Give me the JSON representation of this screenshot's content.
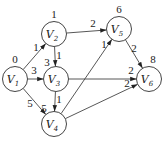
{
  "diagram": {
    "type": "weighted-directed-graph",
    "nodes": [
      {
        "id": "V1",
        "name": "V",
        "sub": "1",
        "x": 15,
        "y": 79,
        "value": "0",
        "vx": 15,
        "vy": 63
      },
      {
        "id": "V2",
        "name": "V",
        "sub": "2",
        "x": 54,
        "y": 34,
        "value": "1",
        "vx": 54,
        "vy": 18
      },
      {
        "id": "V3",
        "name": "V",
        "sub": "3",
        "x": 56,
        "y": 79,
        "value": "3",
        "vx": 47,
        "vy": 66
      },
      {
        "id": "V4",
        "name": "V",
        "sub": "4",
        "x": 54,
        "y": 124,
        "value": "5",
        "vx": 44,
        "vy": 112
      },
      {
        "id": "V5",
        "name": "V",
        "sub": "5",
        "x": 119,
        "y": 29,
        "value": "6",
        "vx": 119,
        "vy": 13
      },
      {
        "id": "V6",
        "name": "V",
        "sub": "6",
        "x": 149,
        "y": 79,
        "value": "8",
        "vx": 153,
        "vy": 63
      }
    ],
    "edges": [
      {
        "from": "V1",
        "to": "V2",
        "weight": "1",
        "lx": 36,
        "ly": 51
      },
      {
        "from": "V1",
        "to": "V3",
        "weight": "3",
        "lx": 34,
        "ly": 74
      },
      {
        "from": "V1",
        "to": "V4",
        "weight": "5",
        "lx": 30,
        "ly": 107
      },
      {
        "from": "V2",
        "to": "V3",
        "weight": "1",
        "lx": 59,
        "ly": 59
      },
      {
        "from": "V2",
        "to": "V5",
        "weight": "2",
        "lx": 93,
        "ly": 27
      },
      {
        "from": "V3",
        "to": "V4",
        "weight": "1",
        "lx": 59,
        "ly": 103
      },
      {
        "from": "V3",
        "to": "V6",
        "weight": "2",
        "lx": 131,
        "ly": 74
      },
      {
        "from": "V4",
        "to": "V5",
        "weight": "1",
        "lx": 104,
        "ly": 48
      },
      {
        "from": "V4",
        "to": "V6",
        "weight": "2",
        "lx": 127,
        "ly": 87
      },
      {
        "from": "V5",
        "to": "V6",
        "weight": "2",
        "lx": 134,
        "ly": 52
      }
    ]
  }
}
